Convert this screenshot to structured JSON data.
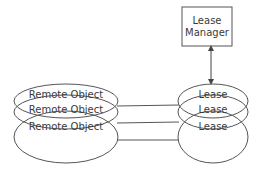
{
  "diagram": {
    "lease_manager": {
      "line1": "Lease",
      "line2": "Manager"
    },
    "remote_objects": [
      {
        "label": "Remote Object"
      },
      {
        "label": "Remote Object"
      },
      {
        "label": "Remote Object"
      }
    ],
    "leases": [
      {
        "label": "Lease"
      },
      {
        "label": "Lease"
      },
      {
        "label": "Lease"
      }
    ],
    "colors": {
      "stroke": "#444444",
      "text": "#3a3a3a",
      "background": "#ffffff"
    }
  }
}
